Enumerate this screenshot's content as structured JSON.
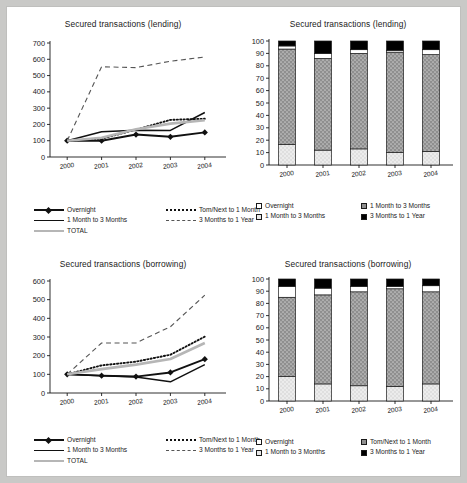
{
  "document": {
    "background_color": "#c9c9c7",
    "panel_color": "#ffffff"
  },
  "panels": [
    {
      "id": "lending-lines",
      "title": "Secured transactions (lending)"
    },
    {
      "id": "lending-bars",
      "title": "Secured transactions (lending)"
    },
    {
      "id": "borrowing-lines",
      "title": "Secured transactions (borrowing)"
    },
    {
      "id": "borrowing-bars",
      "title": "Secured transactions (borrowing)"
    }
  ],
  "legends": {
    "lending_lines": [
      {
        "label": "Overnight",
        "style": "solid-thick-diamond"
      },
      {
        "label": "Tom/Next  to 1 Month",
        "style": "dotted"
      },
      {
        "label": "1 Month to 3 Months",
        "style": "solid-thin"
      },
      {
        "label": "3 Months to 1 Year",
        "style": "dashed"
      },
      {
        "label": "TOTAL",
        "style": "gray-thick"
      }
    ],
    "lending_bars": [
      {
        "label": "Overnight",
        "swatch": "white"
      },
      {
        "label": "1 Month to 3 Months",
        "swatch": "dotted-gray"
      },
      {
        "label": "1 Month to 3 Months",
        "swatch": "light"
      },
      {
        "label": "3 Months to 1 Year",
        "swatch": "black"
      }
    ],
    "borrowing_lines": [
      {
        "label": "Overnight",
        "style": "solid-thick-diamond"
      },
      {
        "label": "Tom/Next  to 1 Month",
        "style": "dotted"
      },
      {
        "label": "1 Month to 3 Months",
        "style": "solid-thin"
      },
      {
        "label": "3 Months to 1 Year",
        "style": "dashed"
      },
      {
        "label": "TOTAL",
        "style": "gray-thick"
      }
    ],
    "borrowing_bars": [
      {
        "label": "Overnight",
        "swatch": "white"
      },
      {
        "label": "Tom/Next  to 1 Month",
        "swatch": "dotted-gray"
      },
      {
        "label": "1 Month to 3 Months",
        "swatch": "light"
      },
      {
        "label": "3 Months to 1 Year",
        "swatch": "black"
      }
    ]
  },
  "chart_data": [
    {
      "id": "lending-lines",
      "type": "line",
      "title": "Secured transactions (lending)",
      "xlabel": "",
      "ylabel": "",
      "x": [
        "2000",
        "2001",
        "2002",
        "2003",
        "2004"
      ],
      "ylim": [
        0,
        700
      ],
      "yticks": [
        0,
        100,
        200,
        300,
        400,
        500,
        600,
        700
      ],
      "grid": false,
      "legend_position": "bottom",
      "series": [
        {
          "name": "Overnight",
          "values": [
            100,
            100,
            138,
            124,
            151
          ],
          "style": "solid-thick-diamond",
          "color": "#111111"
        },
        {
          "name": "Tom/Next  to 1 Month",
          "values": [
            100,
            112,
            168,
            228,
            235
          ],
          "style": "dotted",
          "color": "#111111"
        },
        {
          "name": "1 Month to 3 Months",
          "values": [
            100,
            155,
            165,
            163,
            273
          ],
          "style": "solid-thin",
          "color": "#111111"
        },
        {
          "name": "3 Months to 1 Year",
          "values": [
            100,
            554,
            549,
            588,
            614
          ],
          "style": "dashed",
          "color": "#555555"
        },
        {
          "name": "TOTAL",
          "values": [
            100,
            118,
            170,
            205,
            226
          ],
          "style": "gray-thick",
          "color": "#b6b6b6"
        }
      ]
    },
    {
      "id": "lending-bars",
      "type": "bar",
      "subtype": "stacked-100",
      "title": "Secured transactions (lending)",
      "xlabel": "",
      "ylabel": "",
      "categories": [
        "2000",
        "2001",
        "2002",
        "2003",
        "2004"
      ],
      "ylim": [
        0,
        100
      ],
      "yticks": [
        0,
        10,
        20,
        30,
        40,
        50,
        60,
        70,
        80,
        90,
        100
      ],
      "grid": false,
      "legend_position": "bottom",
      "series": [
        {
          "name": "Overnight",
          "values": [
            16.5,
            12.0,
            13.0,
            10.0,
            11.0
          ],
          "fill": "light-gray-dotted",
          "color": "#e8e8e8"
        },
        {
          "name": "1 Month to 3 Months",
          "values": [
            77.0,
            74.0,
            77.0,
            81.0,
            78.0
          ],
          "fill": "dark-gray-dotted",
          "color": "#8f8f8f"
        },
        {
          "name": "1 Month to 3 Months ",
          "values": [
            2.5,
            4.0,
            3.0,
            1.5,
            4.0
          ],
          "fill": "white",
          "color": "#ffffff"
        },
        {
          "name": "3 Months to 1 Year",
          "values": [
            4.0,
            10.0,
            7.0,
            7.5,
            7.0
          ],
          "fill": "black",
          "color": "#000000"
        }
      ]
    },
    {
      "id": "borrowing-lines",
      "type": "line",
      "title": "Secured transactions (borrowing)",
      "xlabel": "",
      "ylabel": "",
      "x": [
        "2000",
        "2001",
        "2002",
        "2003",
        "2004"
      ],
      "ylim": [
        0,
        600
      ],
      "yticks": [
        0,
        100,
        200,
        300,
        400,
        500,
        600
      ],
      "grid": false,
      "legend_position": "bottom",
      "series": [
        {
          "name": "Overnight",
          "values": [
            100,
            93,
            88,
            110,
            181
          ],
          "style": "solid-thick-diamond",
          "color": "#111111"
        },
        {
          "name": "Tom/Next  to 1 Month",
          "values": [
            100,
            148,
            168,
            205,
            302
          ],
          "style": "dotted",
          "color": "#111111"
        },
        {
          "name": "1 Month to 3 Months",
          "values": [
            100,
            92,
            86,
            60,
            152
          ],
          "style": "solid-thin",
          "color": "#111111"
        },
        {
          "name": "3 Months to 1 Year",
          "values": [
            100,
            268,
            268,
            355,
            524
          ],
          "style": "dashed",
          "color": "#555555"
        },
        {
          "name": "TOTAL",
          "values": [
            100,
            128,
            152,
            182,
            268
          ],
          "style": "gray-thick",
          "color": "#b6b6b6"
        }
      ]
    },
    {
      "id": "borrowing-bars",
      "type": "bar",
      "subtype": "stacked-100",
      "title": "Secured transactions (borrowing)",
      "xlabel": "",
      "ylabel": "",
      "categories": [
        "2000",
        "2001",
        "2002",
        "2003",
        "2004"
      ],
      "ylim": [
        0,
        100
      ],
      "yticks": [
        0,
        10,
        20,
        30,
        40,
        50,
        60,
        70,
        80,
        90,
        100
      ],
      "grid": false,
      "legend_position": "bottom",
      "series": [
        {
          "name": "Overnight",
          "values": [
            20.0,
            14.0,
            12.5,
            12.0,
            14.0
          ],
          "fill": "light-gray-dotted",
          "color": "#e8e8e8"
        },
        {
          "name": "Tom/Next  to 1 Month",
          "values": [
            65.0,
            73.0,
            77.0,
            80.0,
            75.5
          ],
          "fill": "dark-gray-dotted",
          "color": "#8f8f8f"
        },
        {
          "name": "1 Month to 3 Months",
          "values": [
            9.0,
            5.5,
            4.5,
            2.0,
            5.0
          ],
          "fill": "white",
          "color": "#ffffff"
        },
        {
          "name": "3 Months to 1 Year",
          "values": [
            6.0,
            7.5,
            6.0,
            6.0,
            5.5
          ],
          "fill": "black",
          "color": "#000000"
        }
      ]
    }
  ]
}
